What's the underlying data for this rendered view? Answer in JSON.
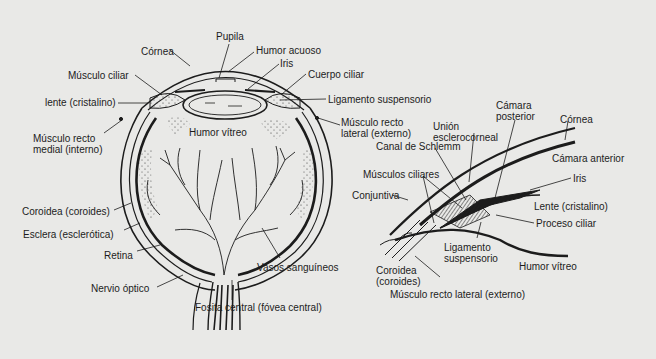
{
  "diagram": {
    "title": "",
    "background_color": "#e9e9e7",
    "line_color": "#1c1c1c",
    "left_figure": {
      "name": "Corte sagital del ojo",
      "labels": [
        {
          "id": "pupila",
          "text": "Pupila",
          "x": 216,
          "y": 31
        },
        {
          "id": "cornea",
          "text": "Córnea",
          "x": 141,
          "y": 46
        },
        {
          "id": "humor-acuoso",
          "text": "Humor acuoso",
          "x": 256,
          "y": 45
        },
        {
          "id": "iris",
          "text": "Iris",
          "x": 280,
          "y": 58
        },
        {
          "id": "musculo-ciliar",
          "text": "Músculo ciliar",
          "x": 68,
          "y": 70
        },
        {
          "id": "cuerpo-ciliar",
          "text": "Cuerpo ciliar",
          "x": 308,
          "y": 69
        },
        {
          "id": "lente",
          "text": "lente (cristalino)",
          "x": 45,
          "y": 97
        },
        {
          "id": "ligamento-suspensorio",
          "text": "Ligamento suspensorio",
          "x": 328,
          "y": 94
        },
        {
          "id": "musculo-recto-lateral",
          "text": "Músculo recto\nlateral (externo)",
          "x": 341,
          "y": 117
        },
        {
          "id": "humor-vitreo",
          "text": "Humor vítreo",
          "x": 189,
          "y": 127
        },
        {
          "id": "musculo-recto-medial",
          "text": "Músculo recto\nmedial (interno)",
          "x": 33,
          "y": 133
        },
        {
          "id": "coroidea",
          "text": "Coroidea (coroides)",
          "x": 22,
          "y": 206
        },
        {
          "id": "esclera",
          "text": "Esclera (esclerótica)",
          "x": 23,
          "y": 229
        },
        {
          "id": "retina",
          "text": "Retina",
          "x": 104,
          "y": 250
        },
        {
          "id": "vasos-sanguineos",
          "text": "Vasos sanguíneos",
          "x": 257,
          "y": 262
        },
        {
          "id": "nervio-optico",
          "text": "Nervio óptico",
          "x": 91,
          "y": 283
        },
        {
          "id": "fosita-central",
          "text": "Fosita central (fóvea central)",
          "x": 195,
          "y": 302
        }
      ]
    },
    "right_figure": {
      "name": "Detalle del ángulo iridocorneal",
      "labels": [
        {
          "id": "camara-posterior",
          "text": "Cámara\nposterior",
          "x": 496,
          "y": 100
        },
        {
          "id": "cornea-2",
          "text": "Córnea",
          "x": 560,
          "y": 114
        },
        {
          "id": "union-esclerocorneal",
          "text": "Unión\nesclerocorneal",
          "x": 433,
          "y": 121
        },
        {
          "id": "canal-schlemm",
          "text": "Canal de Schlemm",
          "x": 376,
          "y": 141
        },
        {
          "id": "camara-anterior",
          "text": "Cámara anterior",
          "x": 552,
          "y": 153
        },
        {
          "id": "musculos-ciliares",
          "text": "Músculos ciliares",
          "x": 363,
          "y": 169
        },
        {
          "id": "iris-2",
          "text": "Iris",
          "x": 573,
          "y": 173
        },
        {
          "id": "conjuntiva",
          "text": "Conjuntiva",
          "x": 352,
          "y": 190
        },
        {
          "id": "lente-2",
          "text": "Lente (cristalino)",
          "x": 534,
          "y": 201
        },
        {
          "id": "proceso-ciliar",
          "text": "Proceso ciliar",
          "x": 536,
          "y": 218
        },
        {
          "id": "ligamento-suspensorio-2",
          "text": "Ligamento\nsuspensorio",
          "x": 444,
          "y": 242
        },
        {
          "id": "humor-vitreo-2",
          "text": "Humor vítreo",
          "x": 519,
          "y": 261
        },
        {
          "id": "coroidea-2",
          "text": "Coroidea\n(coroides)",
          "x": 376,
          "y": 265
        },
        {
          "id": "musculo-recto-lateral-2",
          "text": "Músculo recto lateral (externo)",
          "x": 390,
          "y": 289
        }
      ]
    }
  }
}
